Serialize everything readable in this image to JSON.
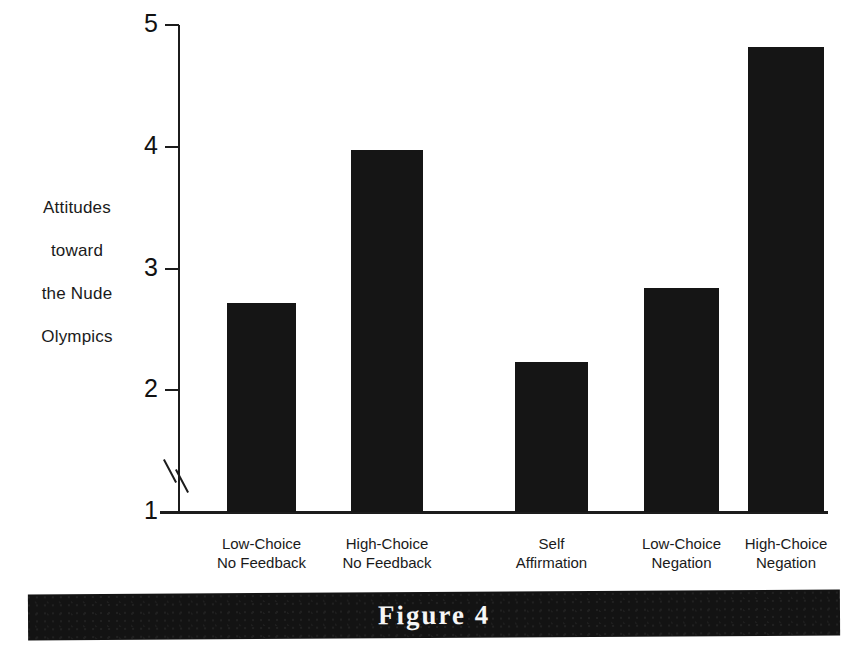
{
  "figure": {
    "caption": "Figure 4"
  },
  "axis": {
    "y_label_lines": [
      "Attitudes",
      "toward",
      "the Nude",
      "Olympics"
    ],
    "y_ticks": [
      "5",
      "4",
      "3",
      "2",
      "1"
    ],
    "break_icon": "axis-break-icon"
  },
  "chart_data": {
    "type": "bar",
    "title": "Figure 4",
    "xlabel": "",
    "ylabel": "Attitudes toward the Nude Olympics",
    "ylim": [
      1,
      5
    ],
    "yticks": [
      1,
      2,
      3,
      4,
      5
    ],
    "y_axis_break": true,
    "grid": false,
    "legend": "none",
    "bar_color": "#151515",
    "categories": [
      "Low-Choice\nNo Feedback",
      "High-Choice\nNo Feedback",
      "Self\nAffirmation",
      "Low-Choice\nNegation",
      "High-Choice\nNegation"
    ],
    "category_lines": [
      [
        "Low-Choice",
        "No Feedback"
      ],
      [
        "High-Choice",
        "No Feedback"
      ],
      [
        "Self",
        "Affirmation"
      ],
      [
        "Low-Choice",
        "Negation"
      ],
      [
        "High-Choice",
        "Negation"
      ]
    ],
    "values": [
      2.72,
      3.97,
      2.23,
      2.84,
      4.82
    ]
  }
}
